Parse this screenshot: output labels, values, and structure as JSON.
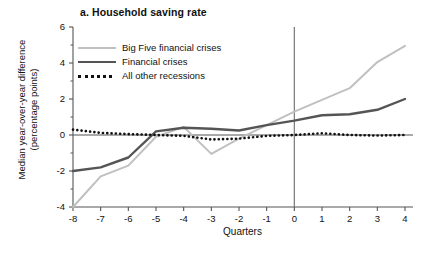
{
  "chart_data": {
    "type": "line",
    "title": "a. Household saving rate",
    "xlabel": "Quarters",
    "ylabel_line1": "Median year-over-year difference",
    "ylabel_line2": "(percentage points)",
    "grid": false,
    "legend_position": "top-left",
    "xlim": [
      -8,
      4
    ],
    "ylim": [
      -4,
      6
    ],
    "xticks": [
      "-8",
      "-7",
      "-6",
      "-5",
      "-4",
      "-3",
      "-2",
      "-1",
      "0",
      "1",
      "2",
      "3",
      "4"
    ],
    "yticks": [
      "6",
      "4",
      "2",
      "0",
      "-2",
      "-4"
    ],
    "x": [
      -8,
      -7,
      -6,
      -5,
      -4,
      -3,
      -2,
      -1,
      0,
      1,
      2,
      3,
      4
    ],
    "reference_line_x": 0,
    "zero_line_y": 0,
    "series": [
      {
        "name": "Big Five financial crises",
        "color": "#c0c0c0",
        "style": "solid",
        "width": 2.0,
        "values": [
          -4.0,
          -2.3,
          -1.7,
          -0.1,
          0.45,
          -1.05,
          -0.2,
          0.55,
          1.3,
          1.95,
          2.6,
          4.05,
          4.95
        ]
      },
      {
        "name": "Financial crises",
        "color": "#555555",
        "style": "solid",
        "width": 2.4,
        "values": [
          -2.0,
          -1.8,
          -1.25,
          0.2,
          0.4,
          0.35,
          0.25,
          0.55,
          0.8,
          1.1,
          1.15,
          1.4,
          2.0
        ]
      },
      {
        "name": "All other recessions",
        "color": "#111111",
        "style": "dotted",
        "width": 2.6,
        "values": [
          0.3,
          0.12,
          0.05,
          0.0,
          -0.05,
          -0.25,
          -0.2,
          -0.05,
          0.0,
          0.1,
          0.0,
          -0.03,
          0.0
        ]
      }
    ]
  }
}
